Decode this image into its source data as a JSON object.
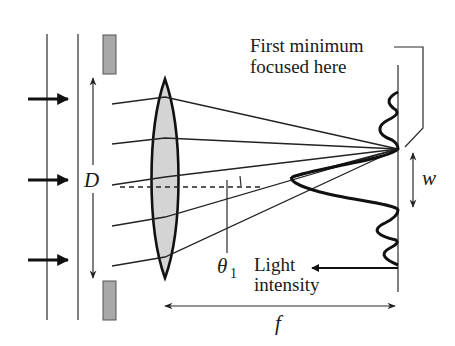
{
  "figure": {
    "colors": {
      "line": "#222222",
      "lens_fill": "#d4d4d4",
      "aperture_fill": "#a8a8a8",
      "background": "#ffffff"
    },
    "labels": {
      "aperture_width": "D",
      "first_minimum_line1": "First minimum",
      "first_minimum_line2": "focused here",
      "central_width": "w",
      "angle": "θ",
      "angle_subscript": "1",
      "intensity_line1": "Light",
      "intensity_line2": "intensity",
      "focal_length": "f"
    },
    "elements": {
      "incoming_arrows": 3,
      "wavefronts": 2,
      "rays": 5,
      "lens": "biconvex",
      "aperture_blocks": 2
    }
  }
}
